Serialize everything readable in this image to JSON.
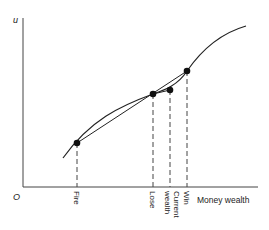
{
  "diagram": {
    "y_axis_label": "u",
    "origin_label": "O",
    "x_axis_label": "Money wealth",
    "points": [
      {
        "name": "fire",
        "label": "Fire"
      },
      {
        "name": "lose",
        "label": "Lose"
      },
      {
        "name": "current",
        "label_line1": "Current",
        "label_line2": "wealth"
      },
      {
        "name": "win",
        "label": "Win"
      }
    ],
    "colors": {
      "ink": "#222222",
      "background": "#ffffff"
    }
  }
}
